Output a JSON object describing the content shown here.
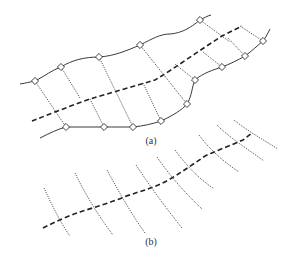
{
  "figure": {
    "panels": [
      {
        "id": "a",
        "caption": "(a)",
        "description": "River channel with two solid bank lines, a dashed centerline, diamond node markers on the banks, and dotted cross-section lines connecting bank nodes",
        "node_count_top_bank": 5,
        "node_count_bottom_bank": 9,
        "cross_section_count": 11
      },
      {
        "id": "b",
        "caption": "(b)",
        "description": "Dashed centerline with dotted cross-section lines crossing it",
        "cross_section_count": 9
      }
    ],
    "legend": {
      "solid_line": "bank line",
      "dashed_line": "centerline",
      "dotted_line": "cross-section",
      "diamond": "node"
    },
    "colors": {
      "background": "#ffffff",
      "ink": "#333333"
    }
  }
}
